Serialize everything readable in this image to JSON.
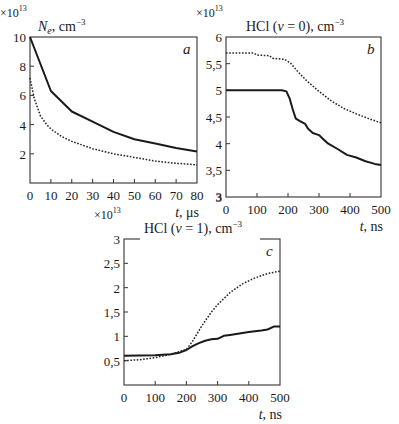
{
  "chart_data": [
    {
      "id": "a",
      "type": "line",
      "panel_letter": "a",
      "scale": "×10",
      "scale_exp": "13",
      "ylabel": "N_e, cm^-3",
      "ylabel_parts": {
        "main": "N",
        "sub": "e",
        "unit": ", cm",
        "exp": "−3"
      },
      "xlabel": "t, μs",
      "xlabel_parts": {
        "var": "t",
        "unit": ",  μs"
      },
      "xlim": [
        0,
        80
      ],
      "ylim": [
        0,
        10
      ],
      "xticks": [
        0,
        10,
        20,
        30,
        40,
        50,
        60,
        70,
        80
      ],
      "yticks": [
        2,
        4,
        6,
        8,
        10
      ],
      "ytick_labels": [
        "2",
        "4",
        "6",
        "8",
        "10"
      ],
      "frame": {
        "x0": 30,
        "x1": 197,
        "y0": 37,
        "y1": 183
      },
      "series": [
        {
          "name": "solid",
          "style": "solid",
          "x": [
            0,
            10,
            20,
            30,
            40,
            50,
            60,
            70,
            80
          ],
          "y": [
            10,
            6.3,
            4.9,
            4.2,
            3.5,
            3.0,
            2.7,
            2.4,
            2.15
          ]
        },
        {
          "name": "dotted",
          "style": "dotted",
          "x": [
            0,
            2,
            5,
            8,
            10,
            15,
            20,
            30,
            40,
            50,
            60,
            70,
            80
          ],
          "y": [
            7.2,
            5.8,
            4.6,
            4.0,
            3.7,
            3.2,
            2.85,
            2.35,
            2.0,
            1.75,
            1.5,
            1.35,
            1.25
          ]
        }
      ]
    },
    {
      "id": "b",
      "type": "line",
      "panel_letter": "b",
      "scale": "×10",
      "scale_exp": "13",
      "ylabel": "HCl (v = 0), cm^-3",
      "ylabel_parts": {
        "main": "HCl (",
        "var": "v",
        "rest": " = 0), cm",
        "exp": "−3"
      },
      "xlabel": "t, ns",
      "xlabel_parts": {
        "var": "t",
        "unit": ",  ns"
      },
      "xlim": [
        0,
        500
      ],
      "ylim": [
        3,
        6
      ],
      "xticks": [
        0,
        100,
        200,
        300,
        400,
        500
      ],
      "yticks": [
        3,
        3.5,
        4,
        4.5,
        5,
        5.5,
        6
      ],
      "ytick_labels": [
        "3",
        "3,5",
        "4",
        "4,5",
        "5",
        "5,5",
        "6"
      ],
      "frame": {
        "x0": 226,
        "x1": 381,
        "y0": 37,
        "y1": 197
      },
      "series": [
        {
          "name": "solid",
          "style": "solid",
          "x": [
            0,
            100,
            180,
            195,
            205,
            215,
            225,
            240,
            255,
            265,
            280,
            300,
            315,
            330,
            360,
            390,
            420,
            450,
            480,
            500
          ],
          "y": [
            5.0,
            5.0,
            5.0,
            4.98,
            4.85,
            4.65,
            4.47,
            4.42,
            4.37,
            4.28,
            4.2,
            4.16,
            4.08,
            4.0,
            3.9,
            3.79,
            3.74,
            3.67,
            3.62,
            3.6
          ]
        },
        {
          "name": "dotted",
          "style": "dotted",
          "x": [
            0,
            90,
            100,
            140,
            150,
            190,
            210,
            230,
            260,
            300,
            340,
            380,
            420,
            460,
            500
          ],
          "y": [
            5.7,
            5.7,
            5.66,
            5.65,
            5.6,
            5.58,
            5.5,
            5.36,
            5.18,
            4.98,
            4.8,
            4.66,
            4.56,
            4.47,
            4.39
          ]
        }
      ]
    },
    {
      "id": "c",
      "type": "line",
      "panel_letter": "c",
      "scale": "×10",
      "scale_exp": "13",
      "ylabel": "HCl (v = 1), cm^-3",
      "ylabel_parts": {
        "main": "HCl (",
        "var": "v",
        "rest": " = 1), cm",
        "exp": "−3"
      },
      "xlabel": "t, ns",
      "xlabel_parts": {
        "var": "t",
        "unit": ",  ns"
      },
      "xlim": [
        0,
        500
      ],
      "ylim": [
        0,
        3
      ],
      "xticks": [
        0,
        100,
        200,
        300,
        400,
        500
      ],
      "yticks": [
        0.5,
        1,
        1.5,
        2,
        2.5,
        3
      ],
      "ytick_labels": [
        "0,5",
        "1",
        "1,5",
        "2",
        "2,5",
        "3"
      ],
      "frame": {
        "x0": 124,
        "x1": 280,
        "y0": 239,
        "y1": 385
      },
      "series": [
        {
          "name": "solid",
          "style": "solid",
          "x": [
            0,
            100,
            150,
            180,
            200,
            220,
            240,
            260,
            280,
            300,
            320,
            340,
            360,
            400,
            440,
            460,
            480,
            500
          ],
          "y": [
            0.6,
            0.61,
            0.63,
            0.67,
            0.72,
            0.8,
            0.86,
            0.91,
            0.94,
            0.95,
            1.01,
            1.03,
            1.05,
            1.09,
            1.12,
            1.14,
            1.2,
            1.2
          ]
        },
        {
          "name": "dotted",
          "style": "dotted",
          "x": [
            0,
            50,
            100,
            150,
            200,
            220,
            250,
            280,
            300,
            340,
            380,
            420,
            460,
            500
          ],
          "y": [
            0.5,
            0.52,
            0.56,
            0.63,
            0.73,
            0.9,
            1.22,
            1.5,
            1.65,
            1.9,
            2.08,
            2.2,
            2.29,
            2.34
          ]
        }
      ]
    }
  ]
}
